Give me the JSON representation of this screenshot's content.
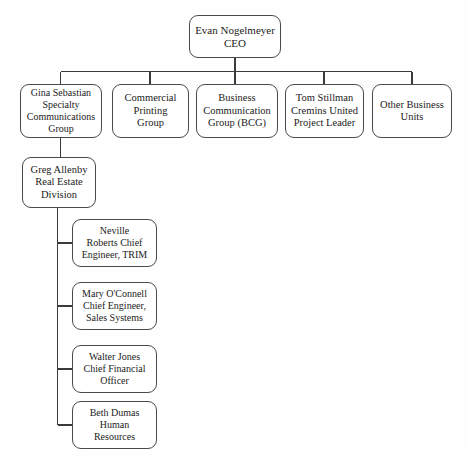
{
  "chart_title": "Organizational Chart",
  "style": {
    "box_stroke": "#4a4a4a",
    "box_fill": "#ffffff",
    "line_color": "#3a3a3a",
    "text_color": "#1b1b1b",
    "background": "#fefefe"
  },
  "nodes": {
    "ceo": {
      "label": "Evan Nogelmeyer\nCEO",
      "x": 189,
      "y": 15,
      "w": 92,
      "h": 43,
      "font": 11
    },
    "specialty_communications": {
      "label": "Gina Sebastian\nSpecialty\nCommunications\nGroup",
      "x": 20,
      "y": 84,
      "w": 82,
      "h": 54,
      "font": 10
    },
    "commercial_printing": {
      "label": "Commercial\nPrinting\nGroup",
      "x": 112,
      "y": 84,
      "w": 77,
      "h": 54,
      "font": 10.5
    },
    "business_communication": {
      "label": "Business\nCommunication\nGroup (BCG)",
      "x": 196,
      "y": 84,
      "w": 82,
      "h": 54,
      "font": 10.5
    },
    "cremins_united": {
      "label": "Tom Stillman\nCremins United\nProject Leader",
      "x": 285,
      "y": 84,
      "w": 79,
      "h": 54,
      "font": 10.5
    },
    "other_business_units": {
      "label": "Other Business\nUnits",
      "x": 372,
      "y": 84,
      "w": 80,
      "h": 54,
      "font": 10.5
    },
    "real_estate_division": {
      "label": "Greg Allenby\nReal Estate\nDivision",
      "x": 22,
      "y": 157,
      "w": 74,
      "h": 51,
      "font": 10.5
    },
    "trim_engineer": {
      "label": "Neville\nRoberts Chief\nEngineer, TRIM",
      "x": 72,
      "y": 219,
      "w": 85,
      "h": 48,
      "font": 10
    },
    "sales_systems_engineer": {
      "label": "Mary O'Connell\nChief Engineer,\nSales Systems",
      "x": 72,
      "y": 282,
      "w": 85,
      "h": 48,
      "font": 10
    },
    "chief_financial_officer": {
      "label": "Walter Jones\nChief Financial\nOfficer",
      "x": 72,
      "y": 345,
      "w": 85,
      "h": 48,
      "font": 10
    },
    "human_resources": {
      "label": "Beth Dumas\nHuman\nResources",
      "x": 72,
      "y": 401,
      "w": 85,
      "h": 48,
      "font": 10
    }
  },
  "connections": [
    {
      "from": "ceo",
      "to": "specialty_communications"
    },
    {
      "from": "ceo",
      "to": "commercial_printing"
    },
    {
      "from": "ceo",
      "to": "business_communication"
    },
    {
      "from": "ceo",
      "to": "cremins_united"
    },
    {
      "from": "ceo",
      "to": "other_business_units"
    },
    {
      "from": "specialty_communications",
      "to": "real_estate_division"
    },
    {
      "from": "real_estate_division",
      "to": "trim_engineer"
    },
    {
      "from": "real_estate_division",
      "to": "sales_systems_engineer"
    },
    {
      "from": "real_estate_division",
      "to": "chief_financial_officer"
    },
    {
      "from": "real_estate_division",
      "to": "human_resources"
    }
  ]
}
